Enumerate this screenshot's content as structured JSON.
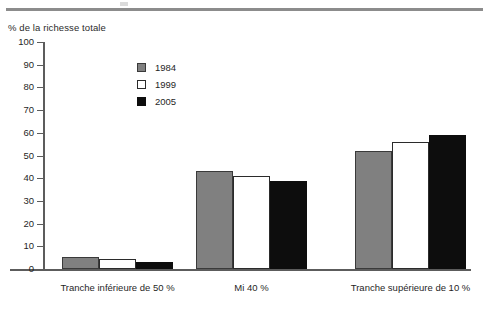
{
  "chart_data": {
    "type": "bar",
    "title": "",
    "subtitle": "",
    "xlabel": "",
    "ylabel": "% de la richesse totale",
    "ylim": [
      0,
      100
    ],
    "ytick_step": 10,
    "yticks": [
      100,
      90,
      80,
      70,
      60,
      50,
      40,
      30,
      20,
      10,
      0
    ],
    "ytick_labels": [
      "100",
      "90",
      "80",
      "70",
      "60",
      "50",
      "40",
      "30",
      "20",
      "10",
      "0"
    ],
    "grid": false,
    "legend_position": "upper-left-inside",
    "categories": [
      "Tranche inférieure de 50 %",
      "Mi 40 %",
      "Tranche supérieure de 10 %"
    ],
    "series": [
      {
        "name": "1984",
        "color": "#808080",
        "edge_color": "#3a3a3a",
        "values": [
          5.3,
          43.0,
          52.0
        ]
      },
      {
        "name": "1999",
        "color": "#ffffff",
        "edge_color": "#2b2b2b",
        "values": [
          4.2,
          41.0,
          56.0
        ]
      },
      {
        "name": "2005",
        "color": "#0d0d0d",
        "edge_color": "#0d0d0d",
        "values": [
          3.2,
          38.7,
          59.0
        ]
      }
    ]
  },
  "legend": {
    "items": [
      {
        "label": "1984"
      },
      {
        "label": "1999"
      },
      {
        "label": "2005"
      }
    ]
  },
  "axis": {
    "y_title": "% de la richesse totale"
  }
}
